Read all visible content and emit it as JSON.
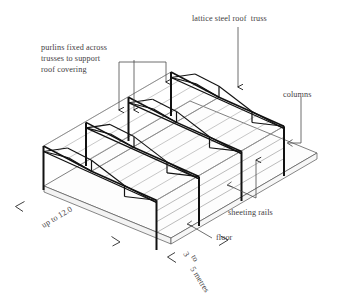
{
  "diagram": {
    "background_color": "#ffffff",
    "line_color": "#1a1a1a",
    "purlin_color": "#9a9a9a",
    "text_color": "#444042"
  },
  "labels": {
    "truss": "lattice steel roof  truss",
    "purlins_line1": "purlins fixed across",
    "purlins_line2": "trusses to support",
    "purlins_line3": "roof covering",
    "columns": "columns",
    "sheeting_rails": "sheeting rails",
    "floor": "floor"
  },
  "dimensions": {
    "span": "up to 12.0",
    "bay_line1": "3",
    "bay_line2": "to",
    "bay_line3": "5 metres"
  },
  "structure": {
    "truss_count": 4,
    "columns_per_truss": 2,
    "purlin_runs_per_slope": 4,
    "sheeting_rail_runs": 3
  }
}
